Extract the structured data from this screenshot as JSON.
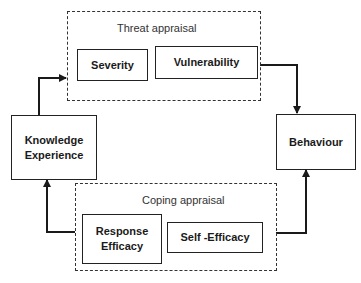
{
  "diagram": {
    "groups": {
      "threat": {
        "label": "Threat appraisal",
        "items": [
          "Severity",
          "Vulnerability"
        ]
      },
      "coping": {
        "label": "Coping appraisal",
        "items": [
          "Response Efficacy",
          "Self -Efficacy"
        ]
      }
    },
    "nodes": {
      "knowledge": {
        "line1": "Knowledge",
        "line2": "Experience"
      },
      "behaviour": {
        "label": "Behaviour"
      },
      "severity": {
        "label": "Severity"
      },
      "vulnerability": {
        "label": "Vulnerability"
      },
      "response": {
        "line1": "Response",
        "line2": "Efficacy"
      },
      "self_efficacy": {
        "label": "Self -Efficacy"
      }
    },
    "edges": [
      {
        "from": "Knowledge Experience",
        "to": "Threat appraisal"
      },
      {
        "from": "Threat appraisal",
        "to": "Behaviour"
      },
      {
        "from": "Coping appraisal",
        "to": "Behaviour"
      },
      {
        "from": "Coping appraisal",
        "to": "Knowledge Experience"
      }
    ],
    "colors": {
      "line": "#1a1a1a",
      "background": "#ffffff"
    }
  }
}
